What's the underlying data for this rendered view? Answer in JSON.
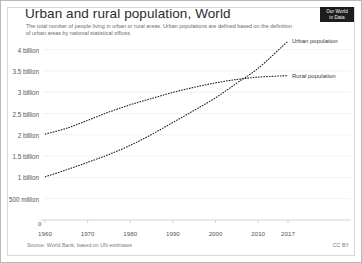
{
  "header": {
    "title": "Urban and rural population, World",
    "subtitle": "The total number of people living in urban or rural areas. Urban populations are defined based on the definition of urban areas by national statistical offices.",
    "logo_line1": "Our World",
    "logo_line2": "in Data"
  },
  "footer": {
    "source": "Source: World Bank, based on UN estimates",
    "license": "CC BY"
  },
  "chart_data": {
    "type": "line",
    "title": "Urban and rural population, World",
    "subtitle": "The total number of people living in urban or rural areas. Urban populations are defined based on the definition of urban areas by national statistical offices.",
    "xlabel": "",
    "ylabel": "",
    "xlim": [
      1960,
      2017
    ],
    "ylim": [
      0,
      4250000000
    ],
    "grid": true,
    "legend_position": "right-inline",
    "x_ticks": [
      1960,
      1970,
      1980,
      1990,
      2000,
      2010,
      2017
    ],
    "x_tick_labels": [
      "1960",
      "1970",
      "1980",
      "1990",
      "2000",
      "2010",
      "2017"
    ],
    "y_ticks": [
      500000000,
      1000000000,
      1500000000,
      2000000000,
      2500000000,
      3000000000,
      3500000000,
      4000000000
    ],
    "y_tick_labels": [
      "500 million",
      "1 billion",
      "1.5 billion",
      "2 billion",
      "2.5 billion",
      "3 billion",
      "3.5 billion",
      "4 billion"
    ],
    "zero_label": "0",
    "x": [
      1960,
      1965,
      1970,
      1975,
      1980,
      1985,
      1990,
      1995,
      2000,
      2005,
      2010,
      2017
    ],
    "series": [
      {
        "name": "Urban population",
        "color": "#1a1a1a",
        "style": "dashed",
        "values": [
          1013000000,
          1177000000,
          1354000000,
          1539000000,
          1754000000,
          2008000000,
          2290000000,
          2575000000,
          2868000000,
          3215000000,
          3563000000,
          4200000000
        ]
      },
      {
        "name": "Rural population",
        "color": "#1a1a1a",
        "style": "dashed",
        "values": [
          2015000000,
          2152000000,
          2340000000,
          2535000000,
          2706000000,
          2855000000,
          2996000000,
          3116000000,
          3220000000,
          3300000000,
          3355000000,
          3390000000
        ]
      }
    ],
    "annotations": [
      {
        "text": "Urban population",
        "x": 2017,
        "y": 4200000000
      },
      {
        "text": "Rural population",
        "x": 2017,
        "y": 3390000000
      }
    ]
  }
}
